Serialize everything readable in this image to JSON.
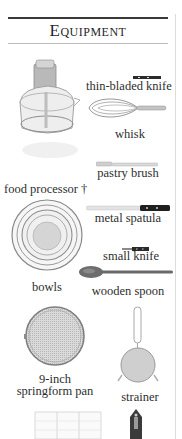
{
  "header": {
    "title": "Equipment"
  },
  "items": [
    {
      "name": "food processor",
      "label": "food processor †"
    },
    {
      "name": "thin-bladed knife",
      "label": "thin-bladed knife"
    },
    {
      "name": "whisk",
      "label": "whisk"
    },
    {
      "name": "pastry brush",
      "label": "pastry brush"
    },
    {
      "name": "metal spatula",
      "label": "metal spatula"
    },
    {
      "name": "small knife",
      "label": "small knife"
    },
    {
      "name": "bowls",
      "label": "bowls"
    },
    {
      "name": "wooden spoon",
      "label": "wooden spoon"
    },
    {
      "name": "springform pan",
      "label_line1": "9-inch",
      "label_line2": "springform pan"
    },
    {
      "name": "strainer",
      "label": "strainer"
    },
    {
      "name": "grater",
      "label": ""
    },
    {
      "name": "piping tip",
      "label": ""
    }
  ],
  "colors": {
    "rule_dark": "#3a3a3a",
    "rule_light": "#bdbdbd",
    "text": "#2e2e2e"
  }
}
